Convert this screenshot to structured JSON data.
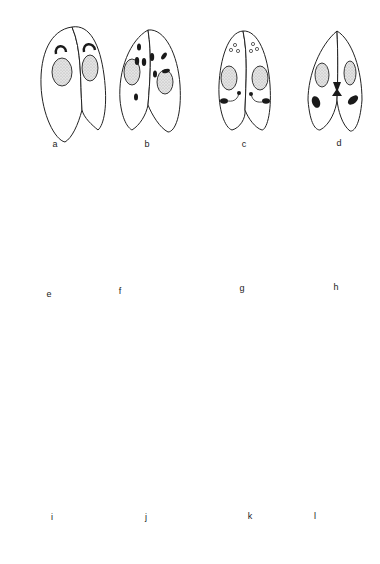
{
  "figure": {
    "type": "scientific line drawing",
    "clipped_top_text": "",
    "panels": [
      {
        "id": "a",
        "label": "a",
        "description": "conjugating pair, micronuclei hook-shaped above stippled macronuclei"
      },
      {
        "id": "b",
        "label": "b",
        "description": "conjugating pair, multiple dark micronuclear products radiating"
      },
      {
        "id": "c",
        "label": "c",
        "description": "conjugating pair, small open vesicles anteriorly, dark bodies with tails below macronuclei"
      },
      {
        "id": "d",
        "label": "d",
        "description": "conjugating pair, nuclei exchanging at junction, dark ovals below"
      },
      {
        "id": "e",
        "label": "e",
        "description": "pair with stippled macronucleus and encapsulated dark body"
      },
      {
        "id": "f",
        "label": "f",
        "description": "separated exconjugants, fragmented macronucleus and round dark nucleus"
      },
      {
        "id": "g",
        "label": "g",
        "description": "single elongated cell, many small fragments and dots"
      },
      {
        "id": "h",
        "label": "h",
        "description": "single elongated cell, fragments and four ringed stippled anlagen"
      },
      {
        "id": "i",
        "label": "i",
        "description": "dividing cell, each half with two ringed anlagen and fragments"
      },
      {
        "id": "j",
        "label": "j",
        "description": "single cell with two stippled anlagen and fragments"
      },
      {
        "id": "k",
        "label": "k",
        "description": "dividing cell, each half with one stippled macronucleus and few dots"
      },
      {
        "id": "l",
        "label": "l",
        "description": "two separate cells, each with a stippled macronucleus and one micronucleus"
      }
    ]
  }
}
